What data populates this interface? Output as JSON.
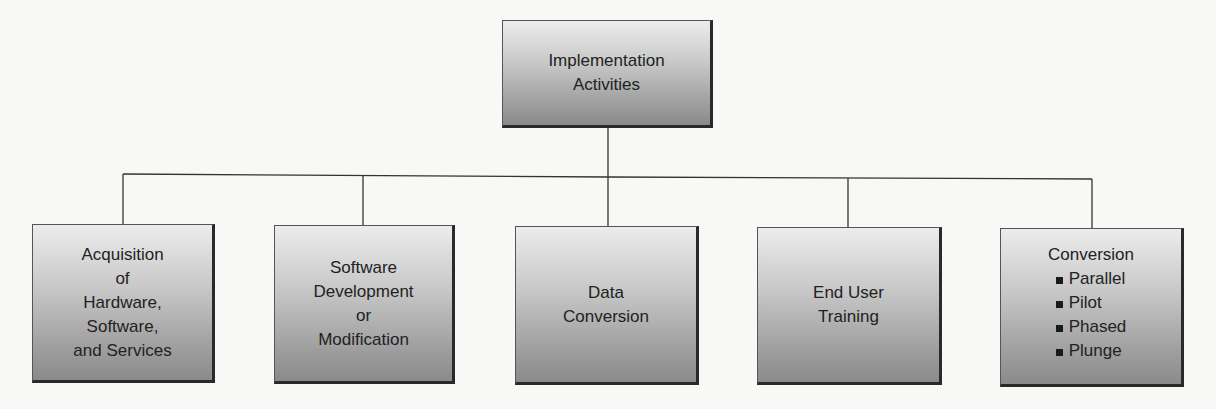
{
  "diagram": {
    "type": "org-chart",
    "root": {
      "label_lines": [
        "Implementation",
        "Activities"
      ]
    },
    "children": [
      {
        "label_lines": [
          "Acquisition",
          "of",
          "Hardware,",
          "Software,",
          "and Services"
        ]
      },
      {
        "label_lines": [
          "Software",
          "Development",
          "or",
          "Modification"
        ]
      },
      {
        "label_lines": [
          "Data",
          "Conversion"
        ]
      },
      {
        "label_lines": [
          "End User",
          "Training"
        ]
      },
      {
        "label_lines": [
          "Conversion"
        ],
        "bullets": [
          "Parallel",
          "Pilot",
          "Phased",
          "Plunge"
        ],
        "bullet_icon": "square-bullet-icon"
      }
    ],
    "colors": {
      "background": "#f8f8f6",
      "box_gradient_top": "#ececec",
      "box_gradient_bottom": "#8a8a8a",
      "box_shadow_border": "#2a2a2a",
      "connector": "#333333",
      "text": "#222222"
    }
  }
}
